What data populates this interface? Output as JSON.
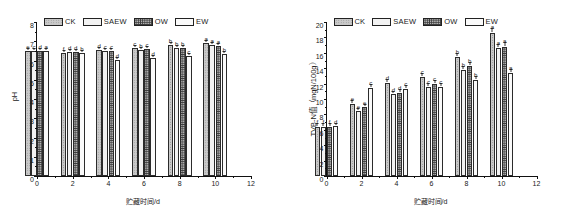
{
  "figure": {
    "series_names": [
      "CK",
      "SAEW",
      "OW",
      "EW"
    ],
    "legend_patterns": [
      "p-ck",
      "p-saew",
      "p-ow",
      "p-ew"
    ],
    "xlabel": "贮藏时间/d",
    "x_ticks": [
      "0",
      "2",
      "4",
      "6",
      "8",
      "10",
      "12"
    ]
  },
  "chart_data": [
    {
      "type": "bar",
      "title": "",
      "panel": "left",
      "xlabel": "贮藏时间/d",
      "ylabel": "pH",
      "categories": [
        "0",
        "2",
        "4",
        "6",
        "8",
        "10"
      ],
      "x": [
        0,
        2,
        4,
        6,
        8,
        10
      ],
      "xlim": [
        0,
        12
      ],
      "ylim": [
        0,
        8
      ],
      "ytick_step": 1,
      "y_ticks": [
        "0",
        "1",
        "2",
        "3",
        "4",
        "5",
        "6",
        "7",
        "8"
      ],
      "grid": false,
      "legend_position": "top-left",
      "series": [
        {
          "name": "CK",
          "values": [
            6.48,
            6.4,
            6.55,
            6.64,
            6.8,
            6.9
          ],
          "errors": [
            0.06,
            0.05,
            0.05,
            0.05,
            0.05,
            0.05
          ],
          "sig_letters": [
            "e",
            "f",
            "d",
            "c",
            "b",
            "a"
          ]
        },
        {
          "name": "SAEW",
          "values": [
            6.5,
            6.42,
            6.52,
            6.56,
            6.66,
            6.8
          ],
          "errors": [
            0.05,
            0.05,
            0.05,
            0.05,
            0.05,
            0.05
          ],
          "sig_letters": [
            "c",
            "d",
            "c",
            "b",
            "b",
            "a"
          ]
        },
        {
          "name": "OW",
          "values": [
            6.52,
            6.43,
            6.5,
            6.58,
            6.64,
            6.78
          ],
          "errors": [
            0.05,
            0.05,
            0.05,
            0.05,
            0.05,
            0.05
          ],
          "sig_letters": [
            "d",
            "d",
            "c",
            "c",
            "b",
            "a"
          ]
        },
        {
          "name": "EW",
          "values": [
            6.5,
            6.4,
            6.05,
            6.12,
            6.22,
            6.35
          ],
          "errors": [
            0.05,
            0.05,
            0.05,
            0.05,
            0.05,
            0.05
          ],
          "sig_letters": [
            "a",
            "b",
            "d",
            "d",
            "c",
            "b"
          ]
        }
      ]
    },
    {
      "type": "bar",
      "title": "",
      "panel": "right",
      "xlabel": "贮藏时间/d",
      "ylabel": "TVB-N值（mgN/100g）",
      "categories": [
        "0",
        "2",
        "4",
        "6",
        "8",
        "10"
      ],
      "x": [
        0,
        2,
        4,
        6,
        8,
        10
      ],
      "xlim": [
        0,
        12
      ],
      "ylim": [
        0,
        20
      ],
      "ytick_step": 2,
      "y_ticks": [
        "0",
        "2",
        "4",
        "6",
        "8",
        "10",
        "12",
        "14",
        "16",
        "18",
        "20"
      ],
      "grid": false,
      "legend_position": "top-left",
      "series": [
        {
          "name": "CK",
          "values": [
            6.4,
            9.4,
            12.1,
            12.9,
            15.4,
            18.6
          ],
          "errors": [
            0.2,
            0.2,
            0.25,
            0.2,
            0.3,
            0.3
          ],
          "sig_letters": [
            "f",
            "e",
            "d",
            "c",
            "b",
            "a"
          ]
        },
        {
          "name": "SAEW",
          "values": [
            6.4,
            8.4,
            10.6,
            11.6,
            13.8,
            16.6
          ],
          "errors": [
            0.2,
            0.2,
            0.2,
            0.2,
            0.25,
            0.3
          ],
          "sig_letters": [
            "f",
            "e",
            "d",
            "c",
            "b",
            "a"
          ]
        },
        {
          "name": "OW",
          "values": [
            6.4,
            8.9,
            10.8,
            12.0,
            14.3,
            16.8
          ],
          "errors": [
            0.2,
            0.2,
            0.2,
            0.2,
            0.25,
            0.3
          ],
          "sig_letters": [
            "f",
            "e",
            "d",
            "c",
            "b",
            "a"
          ]
        },
        {
          "name": "EW",
          "values": [
            6.45,
            11.4,
            11.3,
            11.6,
            12.5,
            13.4
          ],
          "errors": [
            0.2,
            0.25,
            0.2,
            0.2,
            0.25,
            0.25
          ],
          "sig_letters": [
            "d",
            "c",
            "c",
            "c",
            "b",
            "a"
          ]
        }
      ]
    }
  ]
}
